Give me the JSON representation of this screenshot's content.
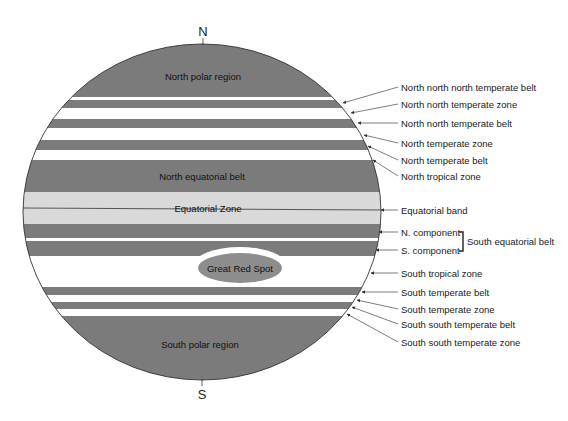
{
  "figure": {
    "poles": {
      "north": "N",
      "south": "S"
    },
    "colors": {
      "belt": "#7b7b7b",
      "zone": "#ffffff",
      "equatorial_zone": "#d9d9d9",
      "great_red_spot": "#8d8d8d",
      "outline": "#333333",
      "text": "#1a1a1a"
    },
    "planet": {
      "cx": 202,
      "cy": 212,
      "rx": 179,
      "ry": 168
    },
    "bands": [
      {
        "name": "North polar region",
        "type": "belt",
        "y0": 0,
        "y1": 97
      },
      {
        "name": "North north north temperate zone",
        "type": "zone",
        "y0": 97,
        "y1": 100
      },
      {
        "name": "North north north temperate belt",
        "type": "belt",
        "y0": 100,
        "y1": 108
      },
      {
        "name": "North north temperate zone",
        "type": "zone",
        "y0": 108,
        "y1": 119
      },
      {
        "name": "North north temperate belt",
        "type": "belt",
        "y0": 119,
        "y1": 128
      },
      {
        "name": "North temperate zone",
        "type": "zone",
        "y0": 128,
        "y1": 140
      },
      {
        "name": "North temperate belt",
        "type": "belt",
        "y0": 140,
        "y1": 150
      },
      {
        "name": "North tropical zone",
        "type": "zone",
        "y0": 150,
        "y1": 160
      },
      {
        "name": "North equatorial belt",
        "type": "belt",
        "y0": 160,
        "y1": 192
      },
      {
        "name": "Equatorial Zone",
        "type": "equatorial",
        "y0": 192,
        "y1": 224
      },
      {
        "name": "N. component",
        "type": "belt",
        "y0": 224,
        "y1": 238
      },
      {
        "name": "SEB gap",
        "type": "zone",
        "y0": 238,
        "y1": 241
      },
      {
        "name": "S. component",
        "type": "belt",
        "y0": 241,
        "y1": 256
      },
      {
        "name": "South tropical zone",
        "type": "zone",
        "y0": 256,
        "y1": 287
      },
      {
        "name": "South temperate belt",
        "type": "belt",
        "y0": 287,
        "y1": 295
      },
      {
        "name": "South temperate zone",
        "type": "zone",
        "y0": 295,
        "y1": 302
      },
      {
        "name": "South south temperate belt",
        "type": "belt",
        "y0": 302,
        "y1": 309
      },
      {
        "name": "South south temperate zone",
        "type": "zone",
        "y0": 309,
        "y1": 316
      },
      {
        "name": "South polar region",
        "type": "belt",
        "y0": 316,
        "y1": 421
      }
    ],
    "inner_labels": {
      "north_polar": "North polar region",
      "north_equatorial_belt": "North equatorial belt",
      "equatorial_zone": "Equatorial Zone",
      "great_red_spot": "Great Red Spot",
      "south_polar": "South polar region"
    },
    "callouts": [
      {
        "label": "North north north temperate belt",
        "tip": [
          343,
          103
        ],
        "from": [
          398,
          87
        ]
      },
      {
        "label": "North north temperate zone",
        "tip": [
          351,
          113
        ],
        "from": [
          398,
          104
        ]
      },
      {
        "label": "North north temperate belt",
        "tip": [
          358,
          123
        ],
        "from": [
          398,
          123
        ]
      },
      {
        "label": "North temperate zone",
        "tip": [
          364,
          135
        ],
        "from": [
          398,
          143
        ]
      },
      {
        "label": "North temperate belt",
        "tip": [
          368,
          146
        ],
        "from": [
          398,
          160
        ]
      },
      {
        "label": "North tropical zone",
        "tip": [
          373,
          160
        ],
        "from": [
          398,
          176
        ]
      },
      {
        "label": "Equatorial band",
        "tip": [
          381,
          210
        ],
        "from": [
          398,
          210
        ]
      },
      {
        "label": "N. component",
        "tip": [
          379,
          232
        ],
        "from": [
          398,
          232
        ]
      },
      {
        "label": "S. component",
        "tip": [
          376,
          250
        ],
        "from": [
          398,
          250
        ]
      },
      {
        "label": "South tropical zone",
        "tip": [
          371,
          273
        ],
        "from": [
          398,
          273
        ]
      },
      {
        "label": "South temperate belt",
        "tip": [
          362,
          292
        ],
        "from": [
          398,
          292
        ]
      },
      {
        "label": "South temperate zone",
        "tip": [
          357,
          300
        ],
        "from": [
          398,
          309
        ]
      },
      {
        "label": "South south temperate belt",
        "tip": [
          352,
          307
        ],
        "from": [
          398,
          324
        ]
      },
      {
        "label": "South south temperate zone",
        "tip": [
          347,
          314
        ],
        "from": [
          398,
          342
        ]
      }
    ],
    "bracket_label": "South equatorial belt"
  }
}
